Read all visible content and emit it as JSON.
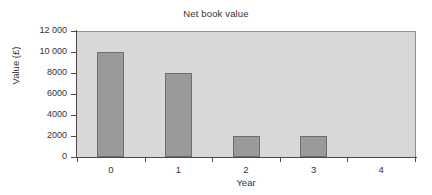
{
  "chart_data": {
    "type": "bar",
    "title": "Net book value",
    "xlabel": "Year",
    "ylabel": "Value (£)",
    "categories": [
      "0",
      "1",
      "2",
      "3",
      "4"
    ],
    "values": [
      10000,
      8000,
      2000,
      2000,
      0
    ],
    "series": [
      {
        "name": "Net book value",
        "values": [
          10000,
          8000,
          2000,
          2000,
          0
        ]
      }
    ],
    "ylim": [
      0,
      12000
    ],
    "ytick_values": [
      0,
      2000,
      4000,
      6000,
      8000,
      10000,
      12000
    ],
    "ytick_labels": [
      "0",
      "2000",
      "4000",
      "6000",
      "8000",
      "10 000",
      "12 000"
    ],
    "grid": false,
    "legend": "none",
    "bar_color": "#9a9a9a",
    "bar_border_color": "#6d6d6d",
    "plot_background": "#d8d8d8",
    "axis_color": "#4a4a4a",
    "figure_background": "#ffffff"
  }
}
